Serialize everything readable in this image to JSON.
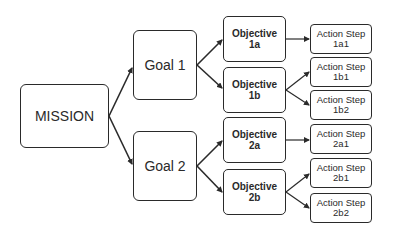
{
  "diagram": {
    "type": "hierarchy",
    "mission": {
      "label": "MISSION"
    },
    "goals": [
      {
        "label": "Goal 1",
        "objectives": [
          {
            "line1": "Objective",
            "line2": "1a",
            "actions": [
              {
                "line1": "Action Step",
                "line2": "1a1"
              }
            ]
          },
          {
            "line1": "Objective",
            "line2": "1b",
            "actions": [
              {
                "line1": "Action Step",
                "line2": "1b1"
              },
              {
                "line1": "Action Step",
                "line2": "1b2"
              }
            ]
          }
        ]
      },
      {
        "label": "Goal 2",
        "objectives": [
          {
            "line1": "Objective",
            "line2": "2a",
            "actions": [
              {
                "line1": "Action Step",
                "line2": "2a1"
              }
            ]
          },
          {
            "line1": "Objective",
            "line2": "2b",
            "actions": [
              {
                "line1": "Action Step",
                "line2": "2b1"
              },
              {
                "line1": "Action Step",
                "line2": "2b2"
              }
            ]
          }
        ]
      }
    ],
    "colors": {
      "stroke": "#2a2a2a",
      "fill": "#ffffff",
      "text": "#2a2a2a"
    }
  }
}
